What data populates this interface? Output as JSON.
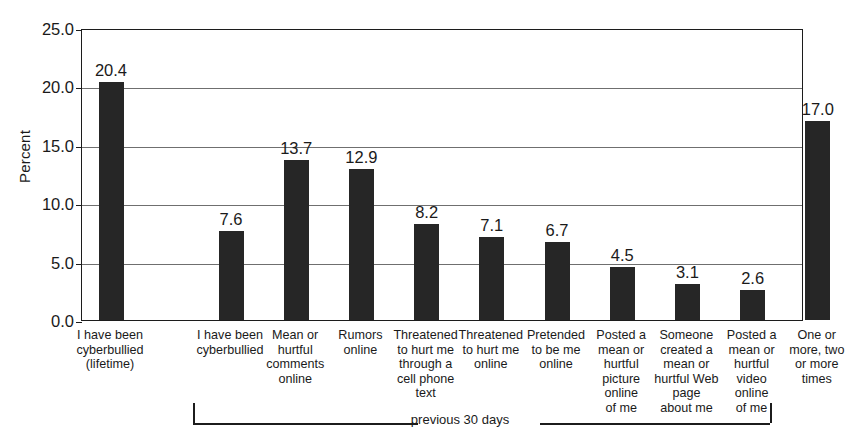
{
  "chart_data": {
    "type": "bar",
    "title": "",
    "subtitle": "",
    "xlabel": "",
    "ylabel": "Percent",
    "ylim": [
      0.0,
      25.0
    ],
    "ytick_labels": [
      "0.0",
      "5.0",
      "10.0",
      "15.0",
      "20.0",
      "25.0"
    ],
    "ytick_values": [
      0,
      5,
      10,
      15,
      20,
      25
    ],
    "grid": true,
    "legend": "none",
    "bar_color": "#262626",
    "categories": [
      "I have been cyberbullied (lifetime)",
      "I have been cyberbullied",
      "Mean or hurtful comments online",
      "Rumors online",
      "Threatened to hurt me through a cell phone text",
      "Threatened to hurt me online",
      "Pretended to be me online",
      "Posted a mean or hurtful picture online of me",
      "Someone created a mean or hurtful Web page about me",
      "Posted a mean or hurtful video online of me",
      "One or more, two or more times"
    ],
    "values": [
      20.4,
      7.6,
      13.7,
      12.9,
      8.2,
      7.1,
      6.7,
      4.5,
      3.1,
      2.6,
      17.0
    ],
    "value_labels": [
      "20.4",
      "7.6",
      "13.7",
      "12.9",
      "8.2",
      "7.1",
      "6.7",
      "4.5",
      "3.1",
      "2.6",
      "17.0"
    ],
    "annotations": [
      {
        "text": "previous 30 days",
        "type": "bracket",
        "covers_categories": [
          1,
          2,
          3,
          4,
          5,
          6,
          7,
          8,
          9,
          10
        ]
      }
    ]
  },
  "category_label_lines": [
    [
      "I have been",
      "cyberbullied",
      "(lifetime)"
    ],
    [
      "I have been",
      "cyberbullied"
    ],
    [
      "Mean or",
      "hurtful",
      "comments",
      "online"
    ],
    [
      "Rumors",
      "online"
    ],
    [
      "Threatened",
      "to hurt me",
      "through a",
      "cell phone",
      "text"
    ],
    [
      "Threatened",
      "to hurt me",
      "online"
    ],
    [
      "Pretended",
      "to be me",
      "online"
    ],
    [
      "Posted a",
      "mean or",
      "hurtful",
      "picture",
      "online",
      "of me"
    ],
    [
      "Someone",
      "created a",
      "mean or",
      "hurtful Web",
      "page",
      "about me"
    ],
    [
      "Posted a",
      "mean or",
      "hurtful",
      "video",
      "online",
      "of me"
    ],
    [
      "One or",
      "more, two",
      "or more",
      "times"
    ]
  ],
  "bracket": {
    "label": "previous 30 days"
  }
}
